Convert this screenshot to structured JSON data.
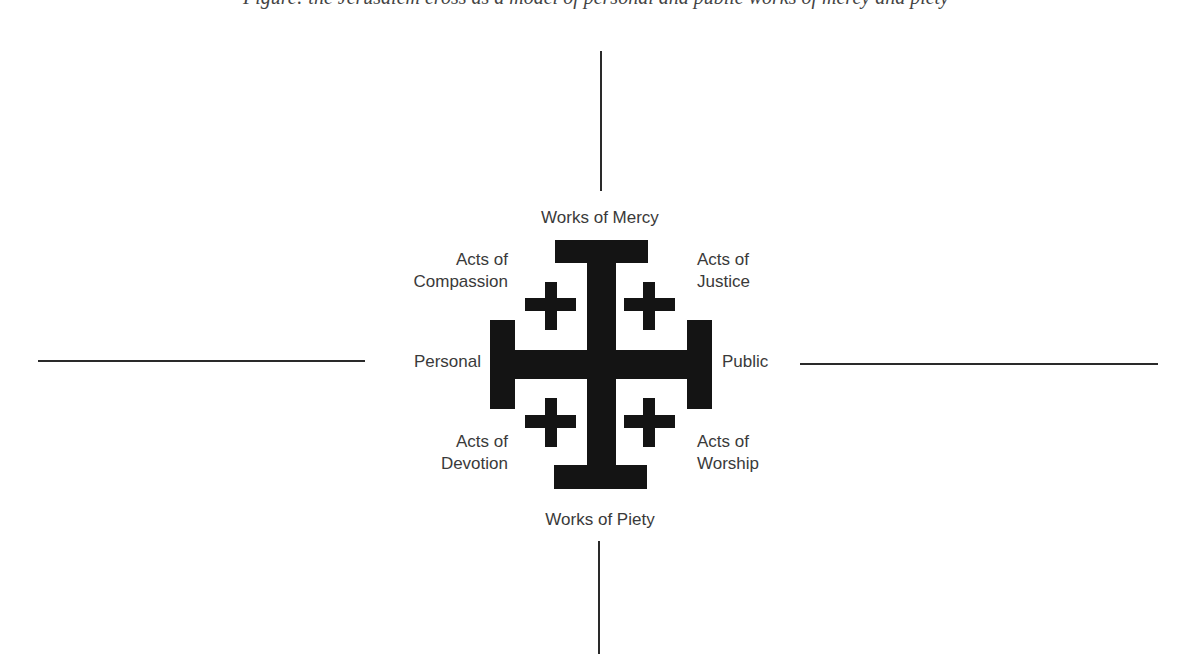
{
  "caption": {
    "text": "Figure: the Jerusalem cross as a model of personal and public works of mercy and piety"
  },
  "diagram": {
    "top": "Works of Mercy",
    "bottom": "Works of Piety",
    "left": "Personal",
    "right": "Public",
    "quadrants": {
      "top_left": [
        "Acts of",
        "Compassion"
      ],
      "top_right": [
        "Acts of",
        "Justice"
      ],
      "bottom_left": [
        "Acts of",
        "Devotion"
      ],
      "bottom_right": [
        "Acts of",
        "Worship"
      ]
    },
    "colors": {
      "cross": "#141414",
      "axis": "#2a2a2a",
      "text": "#3a3a3a",
      "background": "#ffffff"
    }
  }
}
